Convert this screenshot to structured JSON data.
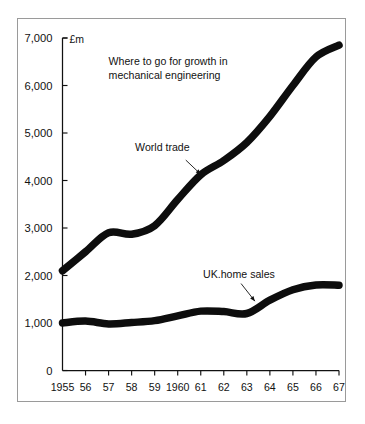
{
  "figure": {
    "background_color": "#ffffff",
    "frame_color": "#9a9a9a",
    "ink_color": "#0d0d0d"
  },
  "chart_data": {
    "type": "line",
    "title": "Where to go for growth in",
    "title_line2": "mechanical engineering",
    "subtitle": "",
    "xlabel": "",
    "ylabel": "",
    "unit_label": "£m",
    "grid": false,
    "legend_position": "inline-annotations",
    "ylim": [
      0,
      7000
    ],
    "yticks": [
      0,
      1000,
      2000,
      3000,
      4000,
      5000,
      6000,
      7000
    ],
    "ytick_labels": [
      "0",
      "1,000",
      "2,000",
      "3,000",
      "4,000",
      "5,000",
      "6,000",
      "7,000"
    ],
    "x": [
      1955,
      1956,
      1957,
      1958,
      1959,
      1960,
      1961,
      1962,
      1963,
      1964,
      1965,
      1966,
      1967
    ],
    "xtick_labels": [
      "1955",
      "56",
      "57",
      "58",
      "59",
      "1960",
      "61",
      "62",
      "63",
      "64",
      "65",
      "66",
      "67"
    ],
    "series": [
      {
        "name": "World trade",
        "label": "World trade",
        "values": [
          2100,
          2500,
          2900,
          2870,
          3050,
          3600,
          4120,
          4420,
          4800,
          5350,
          6000,
          6600,
          6850
        ],
        "color": "#0d0d0d",
        "line_width": 7.5,
        "label_x": 1958.15,
        "label_y": 4620,
        "leader_from": [
          1960.35,
          4430
        ],
        "leader_to": [
          1961.0,
          4130
        ]
      },
      {
        "name": "UK.home sales",
        "label": "UK.home sales",
        "values": [
          1000,
          1040,
          980,
          1010,
          1050,
          1150,
          1250,
          1240,
          1200,
          1480,
          1700,
          1800,
          1795
        ],
        "color": "#0d0d0d",
        "line_width": 7.5,
        "label_x": 1961.1,
        "label_y": 1940,
        "leader_from": [
          1962.75,
          1830
        ],
        "leader_to": [
          1963.35,
          1460
        ]
      }
    ]
  }
}
